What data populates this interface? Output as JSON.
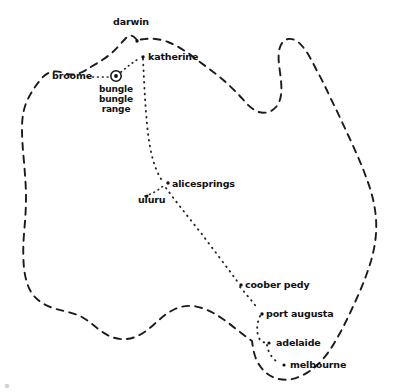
{
  "map": {
    "title": "australia travel route map",
    "style": "hand-drawn sketch",
    "ink_color": "#1b1b1b",
    "background_color": "#ffffff",
    "coastline_style": "dashed",
    "route_style": "dotted"
  },
  "places": [
    {
      "id": "darwin",
      "label": "darwin",
      "marker": "dot",
      "x": 137,
      "y": 40,
      "label_x": 132,
      "label_y": 26,
      "label_anchor": "middle"
    },
    {
      "id": "katherine",
      "label": "katherine",
      "marker": "dot",
      "x": 143,
      "y": 57,
      "label_x": 149,
      "label_y": 60,
      "label_anchor": "start"
    },
    {
      "id": "broome",
      "label": "broome",
      "marker": "none",
      "x": 84,
      "y": 76,
      "label_x": 53,
      "label_y": 79,
      "label_anchor": "start"
    },
    {
      "id": "bungle-bungle",
      "label": "bungle",
      "marker": "ring",
      "x": 116,
      "y": 76,
      "label_x": 116,
      "label_y": 91,
      "label_anchor": "middle"
    },
    {
      "id": "bungle-line2",
      "label": "bungle",
      "marker": "none",
      "x": 116,
      "y": 76,
      "label_x": 116,
      "label_y": 101,
      "label_anchor": "middle"
    },
    {
      "id": "bungle-line3",
      "label": "range",
      "marker": "none",
      "x": 116,
      "y": 76,
      "label_x": 116,
      "label_y": 111,
      "label_anchor": "middle"
    },
    {
      "id": "alicesprings",
      "label": "alicesprings",
      "marker": "dot",
      "x": 167,
      "y": 182,
      "label_x": 172,
      "label_y": 186,
      "label_anchor": "start"
    },
    {
      "id": "uluru",
      "label": "uluru",
      "marker": "none",
      "x": 152,
      "y": 194,
      "label_x": 139,
      "label_y": 202,
      "label_anchor": "start"
    },
    {
      "id": "cooberpedy",
      "label": "coober pedy",
      "marker": "dot",
      "x": 239,
      "y": 284,
      "label_x": 245,
      "label_y": 287,
      "label_anchor": "start"
    },
    {
      "id": "portaugusta",
      "label": "port augusta",
      "marker": "dot",
      "x": 261,
      "y": 313,
      "label_x": 266,
      "label_y": 316,
      "label_anchor": "start"
    },
    {
      "id": "adelaide",
      "label": "adelaide",
      "marker": "dot",
      "x": 268,
      "y": 342,
      "label_x": 275,
      "label_y": 345,
      "label_anchor": "start"
    },
    {
      "id": "melbourne",
      "label": "melbourne",
      "marker": "dot",
      "x": 283,
      "y": 364,
      "label_x": 289,
      "label_y": 367,
      "label_anchor": "start"
    }
  ],
  "route_legs": [
    {
      "from": "katherine",
      "to": "alicesprings"
    },
    {
      "from": "alicesprings",
      "to": "cooberpedy"
    },
    {
      "from": "cooberpedy",
      "to": "portaugusta"
    },
    {
      "from": "portaugusta",
      "to": "adelaide"
    },
    {
      "from": "adelaide",
      "to": "melbourne"
    },
    {
      "from": "broome",
      "to": "bungle-bungle"
    },
    {
      "from": "bungle-bungle",
      "to": "katherine"
    },
    {
      "from": "uluru",
      "to": "alicesprings"
    }
  ],
  "geometry": {
    "coastline_path": "M 137 40 C 133 35 130 34 126 38 C 121 43 116 50 108 56 C 100 62 92 66 86 70 C 79 74 72 76 64 73 C 56 70 48 71 42 78 C 36 85 31 92 27 101 C 23 110 22 119 22 129 C 22 140 23 151 24 162 C 25 174 26 186 26 198 C 26 210 25 222 24 234 C 23 246 23 258 24 268 C 25 277 27 285 31 292 C 36 300 44 305 53 308 C 62 311 71 312 80 316 C 88 320 94 326 101 331 C 109 337 118 340 127 339 C 136 338 144 333 151 327 C 159 320 166 313 175 309 C 184 305 193 305 202 308 C 211 311 219 316 227 322 C 234 327 241 333 248 338 L 252 341 C 253 348 254 355 257 361 C 261 369 267 375 275 378 C 284 381 293 380 301 376 C 310 372 317 366 323 359 C 330 351 335 342 340 333 C 346 322 351 311 356 300 C 362 287 367 274 371 261 C 375 247 377 233 376 219 C 375 204 371 190 366 177 C 361 163 355 150 349 137 C 343 124 337 111 331 99 C 326 88 321 78 316 69 C 312 61 308 53 303 47 C 299 42 294 38 288 39 C 283 40 280 45 279 51 C 278 58 279 65 280 72 C 281 80 282 88 281 95 C 280 102 277 108 271 111 C 265 114 258 113 253 109 C 247 105 243 99 238 94 C 231 87 224 80 216 74 C 208 68 200 62 192 56 C 184 50 176 45 168 42 C 160 39 152 38 145 39 C 142 39 139 40 137 40 Z"
  },
  "corner_mark": {
    "visible": true,
    "x": 7,
    "y": 386
  }
}
